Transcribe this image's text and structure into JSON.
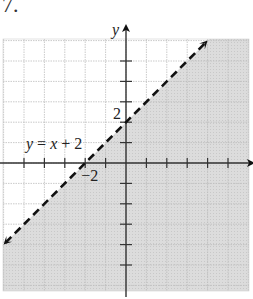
{
  "problem": {
    "number": "7."
  },
  "chart_data": {
    "type": "line",
    "title": "",
    "equation_label": "y = x + 2",
    "xlabel": "x",
    "ylabel": "y",
    "xlim": [
      -6,
      6
    ],
    "ylim": [
      -6,
      6
    ],
    "grid": true,
    "tick_step": 1,
    "tick_labels": [
      {
        "axis": "y",
        "value": 2,
        "text": "2"
      },
      {
        "axis": "x",
        "value": -2,
        "text": "−2"
      }
    ],
    "boundary": {
      "slope": 1,
      "intercept": 2,
      "style": "dashed",
      "x_range": [
        -6,
        4
      ],
      "points": [
        [
          -6,
          -4
        ],
        [
          4,
          6
        ]
      ]
    },
    "shaded_region": "y < x + 2",
    "inequality": "y < x + 2",
    "colors": {
      "shade": "#d9d9d9",
      "grid": "#bdbdbd",
      "axis": "#333333",
      "line": "#111111"
    }
  }
}
